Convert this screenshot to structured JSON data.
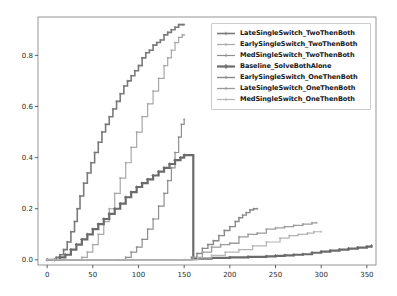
{
  "chart_data": {
    "type": "line",
    "title": "",
    "xlabel": "",
    "ylabel": "",
    "xlim": [
      -10,
      360
    ],
    "ylim": [
      -0.02,
      0.95
    ],
    "xticks": [
      0,
      50,
      100,
      150,
      200,
      250,
      300,
      350
    ],
    "yticks": [
      0.0,
      0.2,
      0.4,
      0.6,
      0.8
    ],
    "xticklabels": [
      "0",
      "50",
      "100",
      "150",
      "200",
      "250",
      "300",
      "350"
    ],
    "yticklabels": [
      "0.0",
      "0.2",
      "0.4",
      "0.6",
      "0.8"
    ],
    "grid": false,
    "legend_position": "upper right",
    "series": [
      {
        "name": "LateSingleSwitch_TwoThenBoth",
        "color": "#7a7a7a",
        "marker": "plus",
        "linewidth": 1.6,
        "x": [
          0,
          6,
          10,
          14,
          18,
          22,
          26,
          30,
          33,
          36,
          40,
          44,
          48,
          52,
          56,
          60,
          64,
          68,
          72,
          76,
          80,
          84,
          88,
          92,
          96,
          100,
          104,
          108,
          112,
          116,
          120,
          124,
          128,
          132,
          136,
          140,
          144,
          148,
          150
        ],
        "y": [
          0.0,
          0.0,
          0.01,
          0.02,
          0.04,
          0.07,
          0.11,
          0.15,
          0.2,
          0.25,
          0.3,
          0.34,
          0.38,
          0.42,
          0.46,
          0.5,
          0.53,
          0.56,
          0.59,
          0.62,
          0.65,
          0.68,
          0.7,
          0.72,
          0.74,
          0.76,
          0.79,
          0.81,
          0.82,
          0.84,
          0.85,
          0.86,
          0.88,
          0.89,
          0.9,
          0.91,
          0.92,
          0.92,
          0.92
        ]
      },
      {
        "name": "EarlySingleSwitch_TwoThenBoth",
        "color": "#a8a8a8",
        "marker": "plus",
        "linewidth": 1.2,
        "x": [
          0,
          30,
          38,
          44,
          50,
          56,
          62,
          68,
          74,
          80,
          86,
          92,
          98,
          104,
          110,
          116,
          122,
          128,
          132,
          136,
          140,
          144,
          148,
          150
        ],
        "y": [
          0.0,
          0.0,
          0.01,
          0.03,
          0.06,
          0.1,
          0.15,
          0.2,
          0.26,
          0.32,
          0.38,
          0.44,
          0.5,
          0.56,
          0.61,
          0.66,
          0.71,
          0.76,
          0.79,
          0.82,
          0.85,
          0.87,
          0.88,
          0.88
        ]
      },
      {
        "name": "MedSingleSwitch_TwoThenBoth",
        "color": "#8f8f8f",
        "marker": "plus",
        "linewidth": 1.2,
        "x": [
          0,
          78,
          86,
          92,
          98,
          104,
          110,
          116,
          122,
          128,
          132,
          136,
          140,
          144,
          147,
          150
        ],
        "y": [
          0.0,
          0.0,
          0.01,
          0.03,
          0.05,
          0.08,
          0.12,
          0.16,
          0.21,
          0.26,
          0.31,
          0.36,
          0.42,
          0.48,
          0.53,
          0.55
        ]
      },
      {
        "name": "Baseline_SolveBothAlone",
        "color": "#6b6b6b",
        "marker": "plus-bold",
        "linewidth": 2.2,
        "x": [
          0,
          8,
          14,
          20,
          26,
          32,
          38,
          44,
          50,
          56,
          62,
          68,
          74,
          80,
          86,
          92,
          98,
          104,
          110,
          116,
          122,
          128,
          134,
          140,
          146,
          150,
          160,
          180,
          200,
          220,
          240,
          250,
          260,
          270,
          280,
          290,
          300,
          310,
          320,
          330,
          340,
          350,
          355
        ],
        "y": [
          0.0,
          0.0,
          0.01,
          0.02,
          0.04,
          0.06,
          0.08,
          0.1,
          0.12,
          0.14,
          0.16,
          0.18,
          0.2,
          0.22,
          0.245,
          0.265,
          0.285,
          0.3,
          0.315,
          0.33,
          0.345,
          0.36,
          0.375,
          0.39,
          0.4,
          0.41,
          0.005,
          0.008,
          0.01,
          0.012,
          0.014,
          0.016,
          0.018,
          0.02,
          0.022,
          0.028,
          0.032,
          0.036,
          0.04,
          0.044,
          0.048,
          0.052,
          0.055
        ]
      },
      {
        "name": "EarlySingleSwitch_OneThenBoth",
        "color": "#8a8a8a",
        "marker": "plus",
        "linewidth": 1.4,
        "x": [
          0,
          150,
          158,
          164,
          170,
          176,
          182,
          188,
          194,
          200,
          206,
          210,
          214,
          218,
          222,
          226,
          230
        ],
        "y": [
          0.0,
          0.0,
          0.01,
          0.025,
          0.045,
          0.06,
          0.075,
          0.095,
          0.115,
          0.13,
          0.15,
          0.165,
          0.175,
          0.185,
          0.195,
          0.2,
          0.2
        ]
      },
      {
        "name": "LateSingleSwitch_OneThenBoth",
        "color": "#9c9c9c",
        "marker": "plus",
        "linewidth": 1.3,
        "x": [
          0,
          150,
          160,
          170,
          180,
          190,
          200,
          210,
          220,
          230,
          240,
          250,
          260,
          270,
          280,
          290,
          295
        ],
        "y": [
          0.0,
          0.0,
          0.01,
          0.03,
          0.05,
          0.06,
          0.065,
          0.09,
          0.1,
          0.105,
          0.12,
          0.125,
          0.13,
          0.135,
          0.14,
          0.145,
          0.145
        ]
      },
      {
        "name": "MedSingleSwitch_OneThenBoth",
        "color": "#b5b5b5",
        "marker": "plus",
        "linewidth": 1.2,
        "x": [
          0,
          150,
          165,
          180,
          195,
          210,
          225,
          240,
          255,
          265,
          275,
          285,
          292,
          300
        ],
        "y": [
          0.0,
          0.0,
          0.008,
          0.018,
          0.03,
          0.04,
          0.055,
          0.07,
          0.085,
          0.095,
          0.1,
          0.105,
          0.11,
          0.11
        ]
      }
    ]
  },
  "legend": {
    "entries": [
      {
        "label": "LateSingleSwitch_TwoThenBoth"
      },
      {
        "label": "EarlySingleSwitch_TwoThenBoth"
      },
      {
        "label": "MedSingleSwitch_TwoThenBoth"
      },
      {
        "label": "Baseline_SolveBothAlone"
      },
      {
        "label": "EarlySingleSwitch_OneThenBoth"
      },
      {
        "label": "LateSingleSwitch_OneThenBoth"
      },
      {
        "label": "MedSingleSwitch_OneThenBoth"
      }
    ]
  },
  "axes": {
    "frame_color": "#8a8a8a",
    "tick_color": "#4d4d4d"
  }
}
